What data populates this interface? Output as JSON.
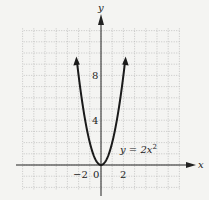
{
  "chart_data": {
    "type": "line",
    "title": "",
    "equation_label": "y = 2x",
    "equation_exponent": "2",
    "xlabel": "x",
    "ylabel": "y",
    "x_ticks": [
      {
        "value": -2,
        "label": "−2"
      },
      {
        "value": 0,
        "label": "0"
      },
      {
        "value": 2,
        "label": "2"
      }
    ],
    "y_ticks": [
      {
        "value": 4,
        "label": "4"
      },
      {
        "value": 8,
        "label": "8"
      }
    ],
    "xlim": [
      -7,
      7
    ],
    "ylim": [
      -2.5,
      12.5
    ],
    "grid": true,
    "series": [
      {
        "name": "y = 2x^2",
        "x": [
          -2.2,
          -2,
          -1.5,
          -1,
          -0.5,
          0,
          0.5,
          1,
          1.5,
          2,
          2.2
        ],
        "y": [
          9.68,
          8,
          4.5,
          2,
          0.5,
          0,
          0.5,
          2,
          4.5,
          8,
          9.68
        ]
      }
    ],
    "colors": {
      "curve": "#1a1a1a",
      "grid": "#9a9a9a",
      "axis": "#222222"
    }
  }
}
